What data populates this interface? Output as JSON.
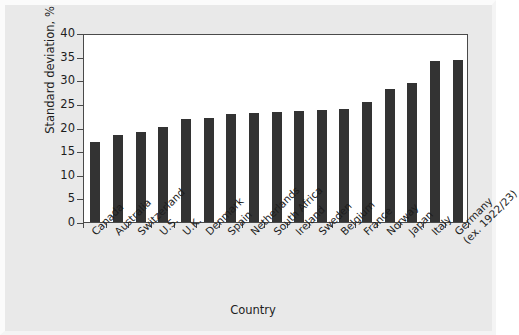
{
  "chart_data": {
    "type": "bar",
    "title": "",
    "xlabel": "Country",
    "ylabel": "Standard deviation, %",
    "ylim": [
      0,
      40
    ],
    "yticks": [
      0,
      5,
      10,
      15,
      20,
      25,
      30,
      35,
      40
    ],
    "grid": false,
    "legend": null,
    "bar_color": "#333333",
    "plot_background": "#ffffff",
    "figure_background": "#e9e9e9",
    "categories": [
      "Canada",
      "Australia",
      "Switzerland",
      "U.S.",
      "U.K.",
      "Denmark",
      "Spain",
      "Netherlands",
      "South Africa",
      "Ireland",
      "Sweden",
      "Belgium",
      "France",
      "Norway",
      "Japan",
      "Italy",
      "Germany"
    ],
    "category_labels": [
      {
        "line1": "Canada",
        "line2": ""
      },
      {
        "line1": "Australia",
        "line2": ""
      },
      {
        "line1": "Switzerland",
        "line2": ""
      },
      {
        "line1": "U.S.",
        "line2": ""
      },
      {
        "line1": "U.K.",
        "line2": ""
      },
      {
        "line1": "Denmark",
        "line2": ""
      },
      {
        "line1": "Spain",
        "line2": ""
      },
      {
        "line1": "Netherlands",
        "line2": ""
      },
      {
        "line1": "South Africa",
        "line2": ""
      },
      {
        "line1": "Ireland",
        "line2": ""
      },
      {
        "line1": "Sweden",
        "line2": ""
      },
      {
        "line1": "Belgium",
        "line2": ""
      },
      {
        "line1": "France",
        "line2": ""
      },
      {
        "line1": "Norway",
        "line2": ""
      },
      {
        "line1": "Japan",
        "line2": ""
      },
      {
        "line1": "Italy",
        "line2": ""
      },
      {
        "line1": "Germany",
        "line2": "(ex. 1922/23)"
      }
    ],
    "values": [
      17.0,
      18.4,
      19.1,
      20.1,
      21.8,
      22.1,
      22.8,
      23.1,
      23.3,
      23.5,
      23.7,
      23.9,
      25.3,
      28.2,
      29.5,
      34.0,
      34.3
    ]
  }
}
